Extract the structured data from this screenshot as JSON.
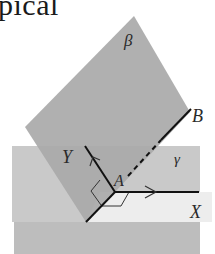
{
  "caption": {
    "text": "pical"
  },
  "figure": {
    "planes": [
      {
        "id": "beta",
        "label": "β"
      },
      {
        "id": "gamma",
        "label": "γ"
      }
    ],
    "points": [
      {
        "id": "A",
        "label": "A"
      }
    ],
    "rays": [
      {
        "id": "X",
        "label": "X"
      },
      {
        "id": "Y",
        "label": "Y"
      },
      {
        "id": "B",
        "label": "B"
      }
    ],
    "colors": {
      "beta_plane": "#a9a9a9",
      "gamma_plane": "#c9c9c9",
      "lower_plane": "#bdbdbd",
      "highlight": "#ededed",
      "line": "#111111",
      "label": "#2a2a2a"
    }
  }
}
